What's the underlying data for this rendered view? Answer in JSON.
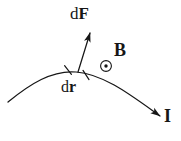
{
  "figure": {
    "background_color": "#ffffff",
    "ink_color": "#161616",
    "width": 181,
    "height": 141
  },
  "labels": {
    "force": {
      "differential": "d",
      "vector": "F",
      "full": "dF",
      "meaning": "differential magnetic force vector"
    },
    "displacement": {
      "differential": "d",
      "vector": "r",
      "full": "dr",
      "meaning": "differential length element of the wire"
    },
    "field": {
      "vector": "B",
      "full": "B",
      "meaning": "magnetic field out of the page"
    },
    "current": {
      "vector": "I",
      "full": "I",
      "meaning": "current direction along the wire"
    }
  },
  "symbols": {
    "field_out_of_page": {
      "name": "circle-dot-icon",
      "glyph": "⊙",
      "meaning": "vector pointing out of the page"
    }
  },
  "geometry": {
    "wire_curve": "M 8 102 C 30 84, 52 70, 76 72 C 104 74, 132 96, 160 116",
    "wire_arrow_tip": [
      160,
      116
    ],
    "force_arrow": {
      "from": [
        78,
        72
      ],
      "to": [
        90,
        33
      ]
    },
    "segment_ticks": [
      {
        "x": 68,
        "y": 70
      },
      {
        "x": 86,
        "y": 75
      }
    ],
    "field_marker": {
      "cx": 106,
      "cy": 66,
      "r": 5.5,
      "dot_r": 1.6
    }
  }
}
